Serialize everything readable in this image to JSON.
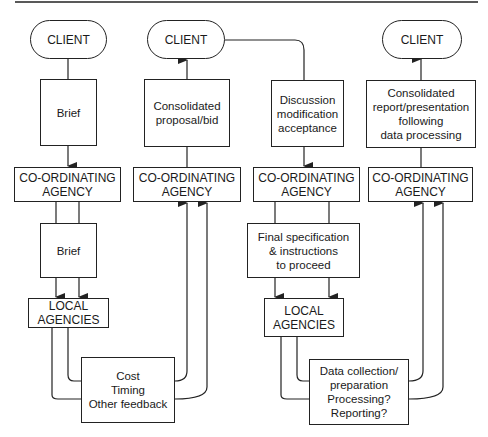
{
  "diagram": {
    "title": "",
    "columns": [
      {
        "id": "briefing",
        "nodes": {
          "client": "CLIENT",
          "brief_top": "Brief",
          "coordinating": "CO-ORDINATING\nAGENCY",
          "brief_bottom": "Brief",
          "local": "LOCAL\nAGENCIES",
          "feedback": "Cost\nTiming\nOther feedback"
        }
      },
      {
        "id": "proposal",
        "nodes": {
          "client": "CLIENT",
          "proposal": "Consolidated\nproposal/bid",
          "coordinating": "CO-ORDINATING\nAGENCY"
        }
      },
      {
        "id": "commission",
        "nodes": {
          "discussion": "Discussion\nmodification\nacceptance",
          "coordinating": "CO-ORDINATING\nAGENCY",
          "final_spec": "Final specification\n& instructions\nto proceed",
          "local": "LOCAL\nAGENCIES",
          "data_collection": "Data collection/\npreparation\nProcessing?\nReporting?"
        }
      },
      {
        "id": "reporting",
        "nodes": {
          "client": "CLIENT",
          "report": "Consolidated\nreport/presentation\nfollowing\ndata processing",
          "coordinating": "CO-ORDINATING\nAGENCY"
        }
      }
    ],
    "edges": [
      {
        "from": "briefing.client",
        "to": "briefing.brief_top",
        "arrow": "none"
      },
      {
        "from": "briefing.brief_top",
        "to": "briefing.coordinating",
        "arrow": "down"
      },
      {
        "from": "briefing.coordinating",
        "to": "briefing.brief_bottom",
        "arrow": "none",
        "count": 2
      },
      {
        "from": "briefing.brief_bottom",
        "to": "briefing.local",
        "arrow": "down",
        "count": 2
      },
      {
        "from": "briefing.local",
        "to": "briefing.feedback",
        "arrow": "none",
        "count": 2
      },
      {
        "from": "briefing.feedback",
        "to": "proposal.coordinating",
        "arrow": "up",
        "count": 2
      },
      {
        "from": "proposal.coordinating",
        "to": "proposal.proposal",
        "arrow": "none"
      },
      {
        "from": "proposal.proposal",
        "to": "proposal.client",
        "arrow": "up"
      },
      {
        "from": "proposal.client",
        "to": "commission.discussion",
        "arrow": "none"
      },
      {
        "from": "commission.discussion",
        "to": "commission.coordinating",
        "arrow": "down"
      },
      {
        "from": "commission.coordinating",
        "to": "commission.final_spec",
        "arrow": "none",
        "count": 2
      },
      {
        "from": "commission.final_spec",
        "to": "commission.local",
        "arrow": "down",
        "count": 2
      },
      {
        "from": "commission.local",
        "to": "commission.data_collection",
        "arrow": "none",
        "count": 2
      },
      {
        "from": "commission.data_collection",
        "to": "reporting.coordinating",
        "arrow": "up",
        "count": 2
      },
      {
        "from": "reporting.coordinating",
        "to": "reporting.report",
        "arrow": "none"
      },
      {
        "from": "reporting.report",
        "to": "reporting.client",
        "arrow": "up"
      }
    ],
    "colors": {
      "stroke": "#222222",
      "background": "#ffffff",
      "text": "#1a1a1a"
    }
  }
}
